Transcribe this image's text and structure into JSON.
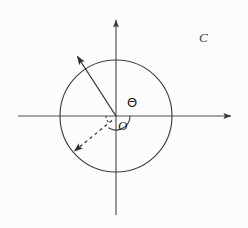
{
  "figure": {
    "width": 248,
    "height": 228,
    "background_color": "#fcfcfc",
    "stroke_color": "#4a4a4a",
    "text_color": "#1b1b1b"
  },
  "labels": {
    "angle": "Θ",
    "origin": "O",
    "curve": "C"
  },
  "axes": {
    "x_axis": {
      "name": "horizontal-axis",
      "y": 116,
      "x_start": 18,
      "x_end": 236,
      "arrow_end": "right"
    },
    "y_axis": {
      "name": "vertical-axis",
      "x": 116,
      "y_start": 215,
      "y_end": 15,
      "arrow_end": "top"
    }
  },
  "circle": {
    "name": "unit-circle",
    "cx": 116,
    "cy": 116,
    "r": 56
  },
  "vectors": [
    {
      "name": "solid-radius-vector",
      "style": "solid",
      "from_x": 116,
      "from_y": 116,
      "to_x": 74,
      "to_y": 52,
      "angle_degrees": 123,
      "arrow": true
    },
    {
      "name": "dashed-radius-vector",
      "style": "dashed",
      "from_x": 116,
      "from_y": 116,
      "to_x": 70,
      "to_y": 155,
      "angle_degrees": 220,
      "arrow": true
    }
  ],
  "arcs": [
    {
      "name": "theta-angle-arc",
      "style": "solid",
      "cx": 116,
      "cy": 116,
      "r": 14,
      "start_degrees": 0,
      "end_degrees": 123
    },
    {
      "name": "lower-angle-arc",
      "style": "dashed",
      "cx": 116,
      "cy": 116,
      "r": 10,
      "start_degrees": 180,
      "end_degrees": 220
    }
  ],
  "label_positions": {
    "angle": {
      "left": 127,
      "top": 96
    },
    "origin": {
      "left": 118,
      "top": 119
    },
    "curve": {
      "left": 199,
      "top": 31
    }
  }
}
